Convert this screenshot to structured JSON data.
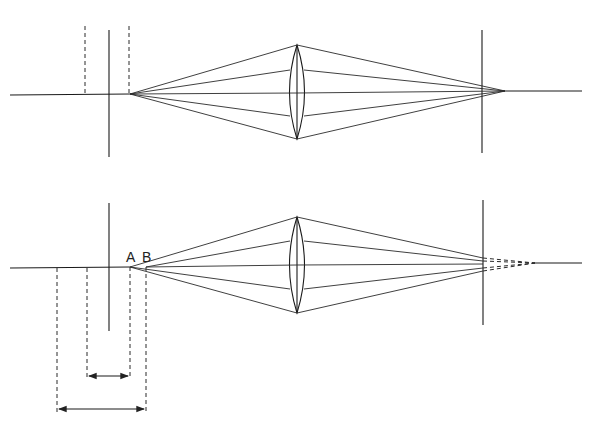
{
  "diagram": {
    "panels": [
      {
        "name": "top",
        "description": "Object point on axis focused on screen",
        "axis_y": 93
      },
      {
        "name": "bottom",
        "description": "Object points A and B; image formed behind screen (dashed)",
        "axis_y": 264
      }
    ],
    "labels": {
      "a": "A",
      "b": "B"
    }
  }
}
